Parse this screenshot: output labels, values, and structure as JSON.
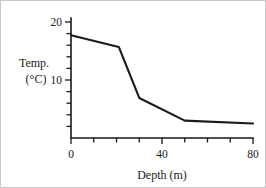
{
  "chart_data": {
    "type": "line",
    "title": "",
    "xlabel": "Depth (m)",
    "ylabel": "Temp. (°C)",
    "ylabel_line1": "Temp.",
    "ylabel_line2": "(°C)",
    "xlim": [
      0,
      80
    ],
    "ylim": [
      0,
      20
    ],
    "grid": false,
    "legend": false,
    "x_tick_step": 10,
    "y_tick_step": 2,
    "x_ticks": [
      0,
      10,
      20,
      30,
      40,
      50,
      60,
      70,
      80
    ],
    "y_ticks": [
      0,
      2,
      4,
      6,
      8,
      10,
      12,
      14,
      16,
      18,
      20
    ],
    "x_tick_labels": [
      {
        "value": 0,
        "text": "0"
      },
      {
        "value": 40,
        "text": "40"
      },
      {
        "value": 80,
        "text": "80"
      }
    ],
    "y_tick_labels": [
      {
        "value": 10,
        "text": "10"
      },
      {
        "value": 20,
        "text": "20"
      }
    ],
    "line_color": "#1a1a1a",
    "background_color": "#ffffff",
    "series": [
      {
        "name": "Temperature profile",
        "x": [
          0,
          21,
          30,
          50,
          80
        ],
        "values": [
          17.7,
          15.7,
          6.9,
          3.0,
          2.5
        ]
      }
    ]
  }
}
